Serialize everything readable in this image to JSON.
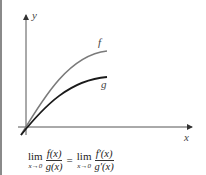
{
  "diagram": {
    "axes": {
      "x_label": "x",
      "y_label": "y"
    },
    "curves": [
      {
        "name": "f",
        "label": "f",
        "color": "#777777"
      },
      {
        "name": "g",
        "label": "g",
        "color": "#1a1a1a"
      }
    ]
  },
  "formula": {
    "lim_word": "lim",
    "lim_sub": "x→0",
    "left_num": "f(x)",
    "left_den": "g(x)",
    "equals": "=",
    "right_num": "f′(x)",
    "right_den": "g′(x)"
  }
}
